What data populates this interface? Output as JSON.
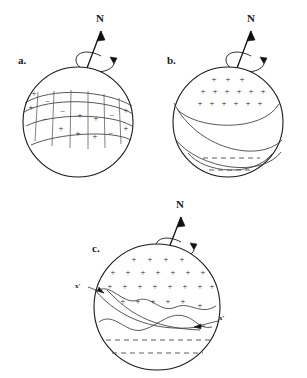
{
  "figure": {
    "background": "#ffffff",
    "ink": "#1a1a1a",
    "width": 307,
    "height": 378
  },
  "panels": [
    {
      "id": "a",
      "label": "a.",
      "axis_label": "N",
      "axis_name": "north-pole-axis",
      "rotation_indicator": "curved-rotation-arrow",
      "description": "Sphere with an inclined banded belt divided into quadrilateral cells alternating plus and minus signs",
      "cx": 78,
      "cy": 122,
      "r": 55,
      "cells": [
        {
          "x": 34,
          "y": 96,
          "sign": "+"
        },
        {
          "x": 31,
          "y": 110,
          "sign": "+"
        },
        {
          "x": 48,
          "y": 104,
          "sign": "−"
        },
        {
          "x": 45,
          "y": 122,
          "sign": "−"
        },
        {
          "x": 63,
          "y": 114,
          "sign": "−"
        },
        {
          "x": 61,
          "y": 131,
          "sign": "+"
        },
        {
          "x": 80,
          "y": 118,
          "sign": "+"
        },
        {
          "x": 78,
          "y": 136,
          "sign": "+"
        },
        {
          "x": 96,
          "y": 121,
          "sign": "+"
        },
        {
          "x": 95,
          "y": 139,
          "sign": "+"
        },
        {
          "x": 112,
          "y": 118,
          "sign": "−"
        },
        {
          "x": 111,
          "y": 136,
          "sign": "−"
        },
        {
          "x": 126,
          "y": 113,
          "sign": "+"
        },
        {
          "x": 126,
          "y": 131,
          "sign": "+"
        }
      ]
    },
    {
      "id": "b",
      "label": "b.",
      "axis_label": "N",
      "axis_name": "north-pole-axis",
      "rotation_indicator": "curved-rotation-arrow",
      "description": "Sphere with a positively charged polar cap of plus signs, two sweeping band curves, and a lower cap with dashed lines",
      "cx": 228,
      "cy": 122,
      "r": 55,
      "plus_rows": [
        {
          "y": 82,
          "xs": [
            214,
            228,
            242
          ]
        },
        {
          "y": 93,
          "xs": [
            203,
            214,
            226,
            238,
            250,
            262
          ]
        },
        {
          "y": 104,
          "xs": [
            200,
            212,
            224,
            236,
            248,
            260
          ]
        }
      ],
      "dashed_lines": [
        {
          "y": 158,
          "x1": 203,
          "x2": 260
        },
        {
          "y": 170,
          "x1": 209,
          "x2": 254
        }
      ]
    },
    {
      "id": "c",
      "label": "c.",
      "axis_label": "N",
      "axis_name": "north-pole-axis",
      "rotation_indicator": "curved-rotation-arrow",
      "description": "Large sphere with an extensive plus-sign region bounded by wavy curves, two x-prime annotation leaders, and a lower cap with dashed lines",
      "cx": 157,
      "cy": 307,
      "r": 63,
      "plus_rows": [
        {
          "y": 262,
          "xs": [
            134,
            150,
            166,
            182
          ]
        },
        {
          "y": 275,
          "xs": [
            113,
            128,
            143,
            158,
            173,
            188,
            203
          ]
        },
        {
          "y": 288,
          "xs": [
            110,
            125,
            140,
            155,
            170,
            185,
            200,
            212
          ]
        },
        {
          "y": 303,
          "xs": [
            123,
            138,
            153,
            168,
            183,
            198
          ]
        }
      ],
      "dashed_lines": [
        {
          "y": 340,
          "x1": 106,
          "x2": 210
        },
        {
          "y": 353,
          "x1": 112,
          "x2": 203
        }
      ],
      "annotations": [
        {
          "name": "x-prime-left",
          "label": "x'",
          "tx": 80,
          "ty": 285,
          "leader": "M 92 286 L 107 292"
        },
        {
          "name": "x-prime-right",
          "label": "x'",
          "tx": 222,
          "ty": 317,
          "leader": "M 220 318 L 196 325"
        }
      ]
    }
  ]
}
